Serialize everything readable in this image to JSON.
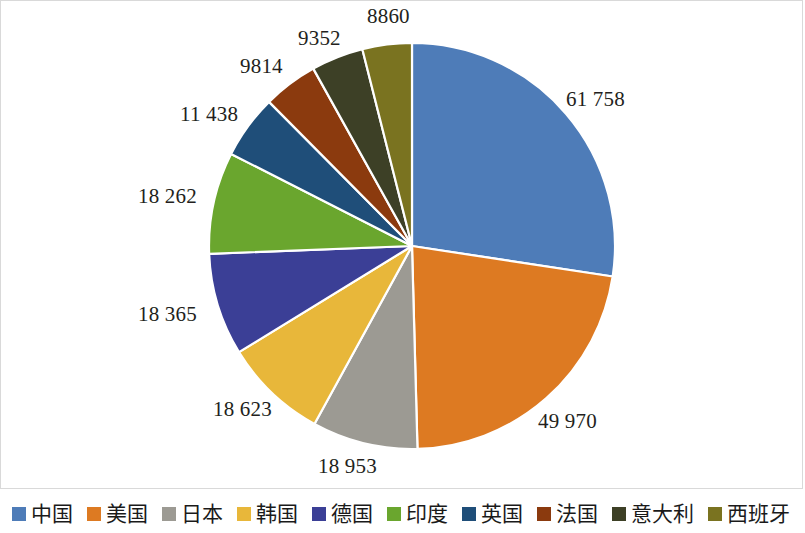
{
  "chart_data": {
    "type": "pie",
    "title": "",
    "subtitle": "",
    "xlabel": "",
    "ylabel": "",
    "legend_position": "bottom",
    "grid": false,
    "start_angle_deg": 0,
    "direction": "clockwise",
    "total": 185495,
    "categories": [
      "中国",
      "美国",
      "日本",
      "韩国",
      "德国",
      "印度",
      "英国",
      "法国",
      "意大利",
      "西班牙"
    ],
    "values": [
      61758,
      49970,
      18953,
      18623,
      18365,
      18262,
      11438,
      9814,
      9352,
      8860
    ],
    "value_labels": [
      "61 758",
      "49 970",
      "18 953",
      "18 623",
      "18 365",
      "18 262",
      "11 438",
      "9814",
      "9352",
      "8860"
    ],
    "colors": [
      "#4e7cb8",
      "#dd7a22",
      "#9c9a93",
      "#e8b73a",
      "#3b3f96",
      "#6aa62e",
      "#1f4e79",
      "#8b3a0e",
      "#3d4026",
      "#7a7320"
    ],
    "slices": [
      {
        "name": "中国",
        "value": 61758,
        "label": "61 758",
        "color": "#4e7cb8",
        "percent": 33.3
      },
      {
        "name": "美国",
        "value": 49970,
        "label": "49 970",
        "color": "#dd7a22",
        "percent": 26.9
      },
      {
        "name": "日本",
        "value": 18953,
        "label": "18 953",
        "color": "#9c9a93",
        "percent": 10.2
      },
      {
        "name": "韩国",
        "value": 18623,
        "label": "18 623",
        "color": "#e8b73a",
        "percent": 10.0
      },
      {
        "name": "德国",
        "value": 18365,
        "label": "18 365",
        "color": "#3b3f96",
        "percent": 9.9
      },
      {
        "name": "印度",
        "value": 18262,
        "label": "18 262",
        "color": "#6aa62e",
        "percent": 9.8
      },
      {
        "name": "英国",
        "value": 11438,
        "label": "11 438",
        "color": "#1f4e79",
        "percent": 6.2
      },
      {
        "name": "法国",
        "value": 9814,
        "label": "9814",
        "color": "#8b3a0e",
        "percent": 5.3
      },
      {
        "name": "意大利",
        "value": 9352,
        "label": "9352",
        "color": "#3d4026",
        "percent": 5.0
      },
      {
        "name": "西班牙",
        "value": 8860,
        "label": "8860",
        "color": "#7a7320",
        "percent": 4.8
      }
    ]
  },
  "legend": {
    "items": [
      {
        "label": "中国",
        "color": "#4e7cb8"
      },
      {
        "label": "美国",
        "color": "#dd7a22"
      },
      {
        "label": "日本",
        "color": "#9c9a93"
      },
      {
        "label": "韩国",
        "color": "#e8b73a"
      },
      {
        "label": "德国",
        "color": "#3b3f96"
      },
      {
        "label": "印度",
        "color": "#6aa62e"
      },
      {
        "label": "英国",
        "color": "#1f4e79"
      },
      {
        "label": "法国",
        "color": "#8b3a0e"
      },
      {
        "label": "意大利",
        "color": "#3d4026"
      },
      {
        "label": "西班牙",
        "color": "#7a7320"
      }
    ]
  },
  "labels": {
    "positions": [
      {
        "bind": "0",
        "x": 566,
        "y": 89,
        "anchor": "start"
      },
      {
        "bind": "1",
        "x": 538,
        "y": 411,
        "anchor": "start"
      },
      {
        "bind": "2",
        "x": 318,
        "y": 456,
        "anchor": "start"
      },
      {
        "bind": "3",
        "x": 213,
        "y": 399,
        "anchor": "start"
      },
      {
        "bind": "4",
        "x": 138,
        "y": 304,
        "anchor": "start"
      },
      {
        "bind": "5",
        "x": 138,
        "y": 186,
        "anchor": "start"
      },
      {
        "bind": "6",
        "x": 180,
        "y": 104,
        "anchor": "start"
      },
      {
        "bind": "7",
        "x": 240,
        "y": 56,
        "anchor": "start"
      },
      {
        "bind": "8",
        "x": 298,
        "y": 28,
        "anchor": "start"
      },
      {
        "bind": "9",
        "x": 367,
        "y": 6,
        "anchor": "start"
      }
    ]
  }
}
